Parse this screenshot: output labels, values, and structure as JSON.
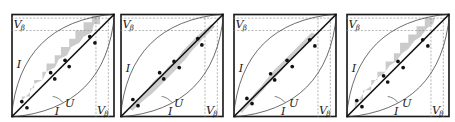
{
  "figure": {
    "panel_count": 4,
    "colors": {
      "frame": "#1a1a1a",
      "diagonal": "#111111",
      "curves": "#333333",
      "dashed": "#888888",
      "shade": "#c8c8c8",
      "dots": "#111111",
      "text": "#222222"
    },
    "labels": {
      "I_left": "I",
      "I_bottom": "I",
      "U": "U",
      "V": "V",
      "beta": "β"
    },
    "panels": [
      {
        "id": 1,
        "shade_style": "staircase",
        "dot_pairs": [
          [
            0.12,
            0.1
          ],
          [
            0.38,
            0.36
          ],
          [
            0.58,
            0.56
          ],
          [
            0.86,
            0.84
          ]
        ]
      },
      {
        "id": 2,
        "shade_style": "band",
        "dot_pairs": [
          [
            0.15,
            0.13
          ],
          [
            0.4,
            0.38
          ],
          [
            0.56,
            0.54
          ],
          [
            0.82,
            0.8
          ]
        ]
      },
      {
        "id": 3,
        "shade_style": "band",
        "dot_pairs": [
          [
            0.17,
            0.15
          ],
          [
            0.4,
            0.38
          ],
          [
            0.58,
            0.56
          ],
          [
            0.84,
            0.82
          ]
        ]
      },
      {
        "id": 4,
        "shade_style": "staircase",
        "dot_pairs": [
          [
            0.17,
            0.15
          ],
          [
            0.4,
            0.38
          ],
          [
            0.58,
            0.56
          ],
          [
            0.84,
            0.82
          ]
        ]
      }
    ]
  }
}
